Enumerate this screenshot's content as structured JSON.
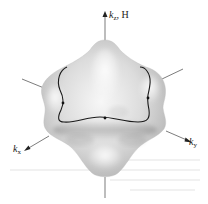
{
  "figure": {
    "axes": {
      "kz": {
        "symbol": "k",
        "subscript": "z",
        "suffix": ", H"
      },
      "kx": {
        "symbol": "k",
        "subscript": "x"
      },
      "ky": {
        "symbol": "k",
        "subscript": "y"
      }
    },
    "colors": {
      "surface_light": "#f4f4f4",
      "surface_mid": "#d6d6d6",
      "surface_dark": "#a9a9a9",
      "lines": "#333333",
      "orbit": "#1a1a1a"
    },
    "orbit_markers": 3
  }
}
